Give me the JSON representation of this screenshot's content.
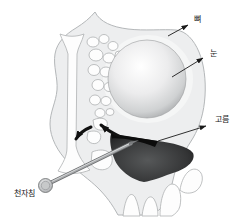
{
  "figure": {
    "labels": {
      "bone": "뼈",
      "eye": "눈",
      "pus": "고름",
      "needle": "천자침"
    },
    "colors": {
      "background": "#ffffff",
      "tissue_fill": "#edeeef",
      "tissue_stroke": "#b4b7b9",
      "cavity_fill": "#fdfdfd",
      "eye_rim": "#8e9092",
      "eye_highlight": "#ffffff",
      "pus_dark": "#0c0c0c",
      "pus_mid": "#353637",
      "needle_gray": "#a8aaac",
      "arrow_black": "#111111",
      "label_text": "#1a1a1a"
    }
  }
}
